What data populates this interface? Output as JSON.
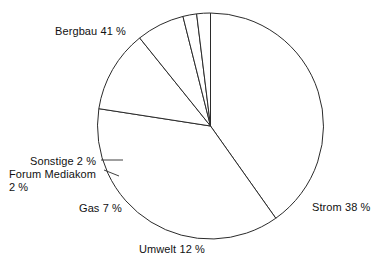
{
  "chart_data": {
    "type": "pie",
    "title": "",
    "subtitle": "",
    "xlabel": "",
    "ylabel": "",
    "legend_position": "none",
    "grid": false,
    "unit": "%",
    "start_angle_deg": 0,
    "direction": "clockwise",
    "categories": [
      "Bergbau",
      "Strom",
      "Umwelt",
      "Gas",
      "Forum Mediakom",
      "Sonstige"
    ],
    "values": [
      41,
      38,
      12,
      7,
      2,
      2
    ],
    "labels": [
      "Bergbau 41 %",
      "Strom 38 %",
      "Umwelt 12 %",
      "Gas 7 %",
      "Forum Mediakom",
      "2 %",
      "Sonstige 2 %"
    ],
    "slices": [
      {
        "name": "Bergbau",
        "value": 41,
        "label": "Bergbau 41 %",
        "leader": false
      },
      {
        "name": "Strom",
        "value": 38,
        "label": "Strom 38 %",
        "leader": false
      },
      {
        "name": "Umwelt",
        "value": 12,
        "label": "Umwelt 12 %",
        "leader": false
      },
      {
        "name": "Gas",
        "value": 7,
        "label": "Gas 7 %",
        "leader": false
      },
      {
        "name": "Forum Mediakom",
        "value": 2,
        "label": "Forum Mediakom 2 %",
        "leader": true
      },
      {
        "name": "Sonstige",
        "value": 2,
        "label": "Sonstige 2 %",
        "leader": true
      }
    ],
    "colors": {
      "slice_fill": "#ffffff",
      "slice_stroke": "#2b2b2b",
      "text": "#111111",
      "background": "#ffffff"
    }
  },
  "labels": {
    "bergbau": "Bergbau 41 %",
    "strom": "Strom 38 %",
    "umwelt": "Umwelt 12 %",
    "gas": "Gas 7 %",
    "sonstige": "Sonstige 2 %",
    "forum_line1": "Forum Mediakom",
    "forum_line2": "2 %"
  }
}
